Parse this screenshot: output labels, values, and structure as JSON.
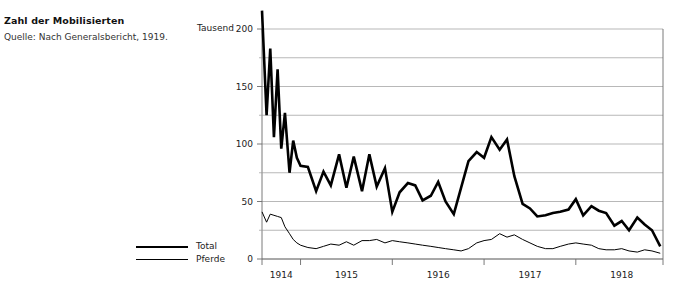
{
  "caption": {
    "title": "Zahl der Mobilisierten",
    "source": "Quelle: Nach Generalsbericht, 1919."
  },
  "legend": {
    "position": "left-of-plot",
    "items": [
      {
        "label": "Total",
        "style": "thick-line",
        "color": "#000000"
      },
      {
        "label": "Pferde",
        "style": "thin-line",
        "color": "#000000"
      }
    ]
  },
  "chart_data": {
    "type": "line",
    "title": "Zahl der Mobilisierten",
    "subtitle": "Quelle: Nach Generalsbericht, 1919.",
    "unit_label": "Tausend",
    "xlabel": "",
    "ylabel": "Tausend",
    "ylim": [
      0,
      200
    ],
    "yticks": [
      0,
      50,
      100,
      150,
      200
    ],
    "yticklabels": [
      "0",
      "50",
      "100",
      "150",
      "200"
    ],
    "yminorticks": [
      25,
      75,
      125,
      175
    ],
    "grid": "horizontal",
    "legend_position": "left",
    "xlim": [
      1914.58,
      1918.95
    ],
    "xticks": [
      1914.58,
      1915.0,
      1916.0,
      1917.0,
      1918.0,
      1918.95
    ],
    "xticklabels": [
      "1914",
      "1915",
      "1916",
      "1917",
      "1918"
    ],
    "xticklabel_positions": [
      1914.79,
      1915.5,
      1916.5,
      1917.5,
      1918.5
    ],
    "x": [
      1914.58,
      1914.63,
      1914.67,
      1914.71,
      1914.75,
      1914.79,
      1914.83,
      1914.88,
      1914.92,
      1914.96,
      1915.0,
      1915.08,
      1915.17,
      1915.25,
      1915.33,
      1915.42,
      1915.5,
      1915.58,
      1915.67,
      1915.75,
      1915.83,
      1915.92,
      1916.0,
      1916.08,
      1916.17,
      1916.25,
      1916.33,
      1916.42,
      1916.5,
      1916.58,
      1916.67,
      1916.75,
      1916.83,
      1916.92,
      1917.0,
      1917.08,
      1917.17,
      1917.25,
      1917.33,
      1917.42,
      1917.5,
      1917.58,
      1917.67,
      1917.75,
      1917.83,
      1917.92,
      1918.0,
      1918.08,
      1918.17,
      1918.25,
      1918.33,
      1918.42,
      1918.5,
      1918.58,
      1918.67,
      1918.75,
      1918.83,
      1918.92
    ],
    "series": [
      {
        "name": "Total",
        "style": "thick-line",
        "color": "#000000",
        "values": [
          216,
          125,
          183,
          106,
          165,
          96,
          127,
          75,
          103,
          88,
          81,
          80,
          59,
          76,
          64,
          91,
          62,
          89,
          59,
          91,
          63,
          79,
          41,
          58,
          66,
          64,
          51,
          55,
          67,
          50,
          39,
          62,
          85,
          93,
          88,
          106,
          95,
          104,
          72,
          48,
          44,
          37,
          38,
          40,
          41,
          43,
          52,
          38,
          46,
          42,
          40,
          29,
          33,
          25,
          36,
          30,
          25,
          11
        ]
      },
      {
        "name": "Pferde",
        "style": "thin-line",
        "color": "#000000",
        "values": [
          41,
          32,
          39,
          38,
          37,
          36,
          28,
          22,
          17,
          14,
          12,
          10,
          9,
          11,
          13,
          12,
          15,
          12,
          16,
          16,
          17,
          14,
          16,
          15,
          14,
          13,
          12,
          11,
          10,
          9,
          8,
          7,
          9,
          14,
          16,
          17,
          22,
          19,
          21,
          17,
          14,
          11,
          9,
          9,
          11,
          13,
          14,
          13,
          12,
          9,
          8,
          8,
          9,
          7,
          6,
          8,
          7,
          5
        ]
      }
    ]
  }
}
